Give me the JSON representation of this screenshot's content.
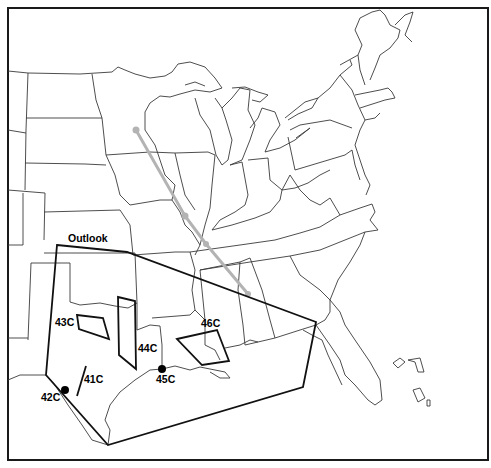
{
  "map": {
    "type": "weather-outlook-map",
    "region": "Central and Eastern United States",
    "outlook_label": "Outlook",
    "outlook_polygon": [
      [
        57,
        245
      ],
      [
        127,
        252
      ],
      [
        316,
        322
      ],
      [
        303,
        387
      ],
      [
        108,
        445
      ],
      [
        46,
        375
      ]
    ],
    "areas": [
      {
        "id": "41C",
        "label": "41C",
        "shape": "line",
        "points": [
          [
            86,
            366
          ],
          [
            77,
            396
          ]
        ],
        "label_pos": [
          84,
          383
        ]
      },
      {
        "id": "42C",
        "label": "42C",
        "shape": "point",
        "points": [
          [
            65,
            390
          ]
        ],
        "label_pos": [
          41,
          401
        ]
      },
      {
        "id": "43C",
        "label": "43C",
        "shape": "polygon",
        "points": [
          [
            77,
            315
          ],
          [
            103,
            318
          ],
          [
            109,
            339
          ],
          [
            79,
            329
          ]
        ],
        "label_pos": [
          55,
          326
        ]
      },
      {
        "id": "44C",
        "label": "44C",
        "shape": "polygon",
        "points": [
          [
            118,
            297
          ],
          [
            135,
            301
          ],
          [
            136,
            369
          ],
          [
            119,
            355
          ]
        ],
        "label_pos": [
          138,
          352
        ]
      },
      {
        "id": "45C",
        "label": "45C",
        "shape": "point",
        "points": [
          [
            162,
            369
          ]
        ],
        "label_pos": [
          156,
          383
        ]
      },
      {
        "id": "46C",
        "label": "46C",
        "shape": "polygon",
        "points": [
          [
            177,
            339
          ],
          [
            217,
            330
          ],
          [
            229,
            361
          ],
          [
            202,
            365
          ]
        ],
        "label_pos": [
          201,
          327
        ]
      }
    ],
    "track": {
      "color": "#b3b3b3",
      "points": [
        [
          136,
          130
        ],
        [
          185,
          216
        ],
        [
          206,
          244
        ],
        [
          248,
          294
        ]
      ]
    },
    "colors": {
      "background": "#ffffff",
      "borders": "#3a3a3a",
      "outlook": "#111111",
      "track": "#b3b3b3"
    }
  }
}
